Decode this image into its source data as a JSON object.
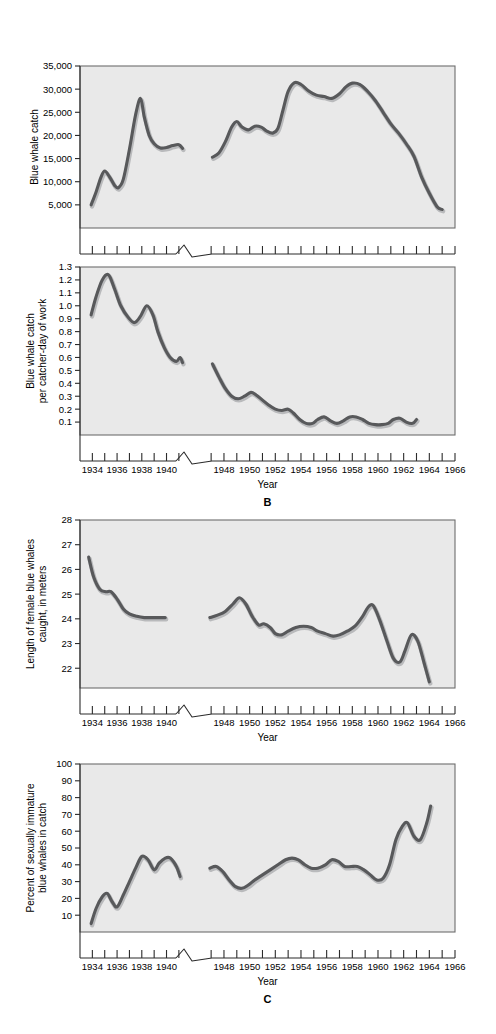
{
  "figure": {
    "background": "#ffffff",
    "line_color": "#58595b",
    "plot_background": "#e9e9e9",
    "axis_color": "#2b2b2b",
    "panel_letters": [
      {
        "label": "B",
        "after_panel": 2
      },
      {
        "label": "C",
        "after_panel": 4
      }
    ]
  },
  "shared_x": {
    "label": "Year",
    "tick_labels": [
      "1934",
      "1936",
      "1938",
      "1940",
      "1948",
      "1950",
      "1952",
      "1954",
      "1956",
      "1958",
      "1960",
      "1962",
      "1964",
      "1966"
    ],
    "minor_years_segment1": [
      1934,
      1935,
      1936,
      1937,
      1938,
      1939,
      1940,
      1941
    ],
    "minor_years_segment2": [
      1947,
      1948,
      1949,
      1950,
      1951,
      1952,
      1953,
      1954,
      1955,
      1956,
      1957,
      1958,
      1959,
      1960,
      1961,
      1962,
      1963,
      1964,
      1965,
      1966
    ],
    "break_between": [
      1941,
      1947
    ],
    "axis_break_symbol": "zigzag"
  },
  "chart_data": [
    {
      "type": "line",
      "panel": "A",
      "title": "",
      "xlabel": "Year",
      "ylabel": "Blue whale catch",
      "ylabel_lines": [
        "Blue whale catch"
      ],
      "ytick_labels": [
        "5,000",
        "10,000",
        "15,000",
        "20,000",
        "25,000",
        "30,000",
        "35,000"
      ],
      "ytick_values": [
        5000,
        10000,
        15000,
        20000,
        25000,
        30000,
        35000
      ],
      "ylim": [
        0,
        35000
      ],
      "xlim": [
        1933,
        1966
      ],
      "grid": false,
      "legend": "none",
      "series": [
        {
          "name": "prewar",
          "x": [
            1933.9,
            1934.3,
            1934.7,
            1935.0,
            1935.4,
            1935.8,
            1936.1,
            1936.5,
            1937.0,
            1937.5,
            1937.9,
            1938.2,
            1938.6,
            1939.0,
            1939.5,
            1940.0,
            1940.5,
            1941.0,
            1941.3
          ],
          "values": [
            5000,
            7800,
            11000,
            12300,
            11000,
            9200,
            8700,
            10500,
            17000,
            24500,
            28000,
            24000,
            20000,
            18200,
            17300,
            17400,
            17800,
            18000,
            17200
          ]
        },
        {
          "name": "postwar",
          "x": [
            1947.1,
            1947.6,
            1948.1,
            1948.6,
            1949.0,
            1949.4,
            1949.9,
            1950.4,
            1950.9,
            1951.3,
            1951.8,
            1952.2,
            1952.6,
            1953.0,
            1953.5,
            1954.0,
            1954.6,
            1955.2,
            1955.8,
            1956.4,
            1957.0,
            1957.5,
            1958.0,
            1958.6,
            1959.2,
            1959.8,
            1960.4,
            1961.0,
            1961.6,
            1962.2,
            1962.8,
            1963.4,
            1964.0,
            1964.6,
            1965.0
          ],
          "values": [
            15300,
            16200,
            18600,
            21800,
            23000,
            21800,
            21200,
            22000,
            21800,
            21000,
            20500,
            21500,
            25500,
            29500,
            31400,
            31000,
            29600,
            28700,
            28400,
            28000,
            29000,
            30500,
            31300,
            31000,
            29500,
            27500,
            25000,
            22500,
            20500,
            18200,
            15500,
            11000,
            7500,
            4600,
            4000
          ]
        }
      ]
    },
    {
      "type": "line",
      "panel": "B",
      "title": "",
      "xlabel": "Year",
      "ylabel": "Blue whale catch per catcher-day of work",
      "ylabel_lines": [
        "Blue whale catch",
        "per catcher-day of work"
      ],
      "ytick_labels": [
        "0.1",
        "0.2",
        "0.3",
        "0.4",
        "0.5",
        "0.6",
        "0.7",
        "0.8",
        "0.9",
        "1.0",
        "1.1",
        "1.2",
        "1.3"
      ],
      "ytick_values": [
        0.1,
        0.2,
        0.3,
        0.4,
        0.5,
        0.6,
        0.7,
        0.8,
        0.9,
        1.0,
        1.1,
        1.2,
        1.3
      ],
      "ylim": [
        0.0,
        1.3
      ],
      "xlim": [
        1933,
        1966
      ],
      "grid": false,
      "legend": "none",
      "series": [
        {
          "name": "prewar",
          "x": [
            1933.9,
            1934.3,
            1934.8,
            1935.3,
            1935.8,
            1936.3,
            1936.9,
            1937.4,
            1937.9,
            1938.4,
            1938.9,
            1939.3,
            1939.8,
            1940.3,
            1940.8,
            1941.1,
            1941.3
          ],
          "values": [
            0.93,
            1.07,
            1.2,
            1.24,
            1.13,
            1.0,
            0.91,
            0.87,
            0.92,
            1.0,
            0.93,
            0.8,
            0.68,
            0.6,
            0.57,
            0.6,
            0.56
          ]
        },
        {
          "name": "postwar",
          "x": [
            1947.1,
            1947.6,
            1948.1,
            1948.6,
            1949.1,
            1949.6,
            1950.1,
            1950.5,
            1951.0,
            1951.5,
            1952.0,
            1952.5,
            1953.0,
            1953.4,
            1953.9,
            1954.4,
            1954.9,
            1955.3,
            1955.8,
            1956.3,
            1956.8,
            1957.3,
            1957.8,
            1958.3,
            1958.8,
            1959.3,
            1959.8,
            1960.3,
            1960.8,
            1961.2,
            1961.7,
            1962.2,
            1962.7,
            1963.0
          ],
          "values": [
            0.55,
            0.45,
            0.36,
            0.3,
            0.28,
            0.3,
            0.33,
            0.31,
            0.27,
            0.23,
            0.2,
            0.19,
            0.2,
            0.17,
            0.12,
            0.09,
            0.09,
            0.12,
            0.14,
            0.11,
            0.09,
            0.11,
            0.14,
            0.14,
            0.12,
            0.09,
            0.08,
            0.08,
            0.09,
            0.12,
            0.13,
            0.1,
            0.09,
            0.12
          ]
        }
      ]
    },
    {
      "type": "line",
      "panel": "",
      "title": "",
      "xlabel": "Year",
      "ylabel": "Length of female blue whales caught, in meters",
      "ylabel_lines": [
        "Length of female blue whales",
        "caught, in meters"
      ],
      "ytick_labels": [
        "22",
        "23",
        "24",
        "25",
        "26",
        "27",
        "28"
      ],
      "ytick_values": [
        22,
        23,
        24,
        25,
        26,
        27,
        28
      ],
      "ylim": [
        21.2,
        28
      ],
      "xlim": [
        1933,
        1966
      ],
      "grid": false,
      "legend": "none",
      "series": [
        {
          "name": "prewar",
          "x": [
            1933.7,
            1934.1,
            1934.6,
            1935.1,
            1935.5,
            1936.0,
            1936.5,
            1937.0,
            1937.6,
            1938.2,
            1938.8,
            1939.4,
            1939.9
          ],
          "values": [
            26.5,
            25.7,
            25.2,
            25.1,
            25.1,
            24.8,
            24.4,
            24.2,
            24.1,
            24.05,
            24.05,
            24.05,
            24.05
          ]
        },
        {
          "name": "postwar",
          "x": [
            1946.9,
            1947.5,
            1948.1,
            1948.7,
            1949.2,
            1949.7,
            1950.2,
            1950.7,
            1951.1,
            1951.6,
            1952.0,
            1952.5,
            1953.0,
            1953.6,
            1954.2,
            1954.8,
            1955.3,
            1955.9,
            1956.5,
            1957.0,
            1957.6,
            1958.2,
            1958.8,
            1959.2,
            1959.6,
            1960.1,
            1960.7,
            1961.2,
            1961.7,
            1962.1,
            1962.6,
            1963.1,
            1963.6,
            1964.0
          ],
          "values": [
            24.05,
            24.15,
            24.3,
            24.6,
            24.85,
            24.6,
            24.1,
            23.75,
            23.8,
            23.65,
            23.4,
            23.35,
            23.5,
            23.65,
            23.7,
            23.65,
            23.5,
            23.4,
            23.3,
            23.35,
            23.5,
            23.7,
            24.1,
            24.45,
            24.55,
            24.0,
            23.1,
            22.4,
            22.25,
            22.7,
            23.35,
            23.1,
            22.2,
            21.45
          ]
        }
      ]
    },
    {
      "type": "line",
      "panel": "C",
      "title": "",
      "xlabel": "Year",
      "ylabel": "Percent of sexually immature blue whales in catch",
      "ylabel_lines": [
        "Percent of sexually immature",
        "blue whales in catch"
      ],
      "ytick_labels": [
        "10",
        "20",
        "30",
        "40",
        "50",
        "60",
        "70",
        "80",
        "90",
        "100"
      ],
      "ytick_values": [
        10,
        20,
        30,
        40,
        50,
        60,
        70,
        80,
        90,
        100
      ],
      "ylim": [
        0,
        100
      ],
      "xlim": [
        1933,
        1966
      ],
      "grid": false,
      "legend": "none",
      "series": [
        {
          "name": "prewar",
          "x": [
            1933.9,
            1934.3,
            1934.8,
            1935.2,
            1935.6,
            1936.0,
            1936.5,
            1937.0,
            1937.5,
            1938.0,
            1938.5,
            1939.0,
            1939.4,
            1939.9,
            1940.3,
            1940.8,
            1941.1
          ],
          "values": [
            5,
            14,
            21,
            23,
            18,
            15,
            22,
            30,
            38,
            45,
            43,
            37,
            41,
            44,
            44,
            39,
            33
          ]
        },
        {
          "name": "postwar",
          "x": [
            1946.9,
            1947.4,
            1947.9,
            1948.4,
            1948.9,
            1949.4,
            1949.9,
            1950.4,
            1951.0,
            1951.6,
            1952.2,
            1952.8,
            1953.3,
            1953.8,
            1954.3,
            1954.8,
            1955.3,
            1955.9,
            1956.4,
            1956.9,
            1957.4,
            1957.9,
            1958.4,
            1958.9,
            1959.4,
            1959.9,
            1960.4,
            1960.9,
            1961.4,
            1961.9,
            1962.3,
            1962.8,
            1963.3,
            1963.8,
            1964.1
          ],
          "values": [
            38,
            39,
            36,
            31,
            27,
            26,
            28,
            31,
            34,
            37,
            40,
            43,
            44,
            43,
            40,
            38,
            38,
            40,
            43,
            42,
            39,
            39,
            39,
            37,
            34,
            31,
            32,
            40,
            55,
            63,
            65,
            57,
            55,
            65,
            75
          ]
        }
      ]
    }
  ]
}
